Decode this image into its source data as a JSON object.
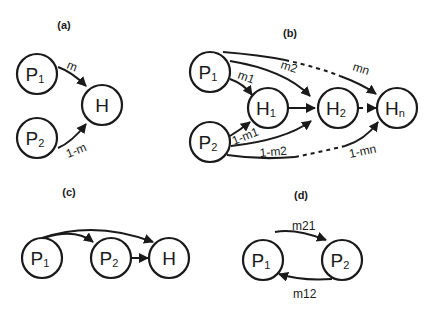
{
  "panels": {
    "a": {
      "label": "(a)",
      "nodes": {
        "p1": "P",
        "p1_sub": "1",
        "p2": "P",
        "p2_sub": "2",
        "h": "H"
      },
      "edges": {
        "p1_h": "m",
        "p2_h": "1-m"
      }
    },
    "b": {
      "label": "(b)",
      "nodes": {
        "p1": "P",
        "p1_sub": "1",
        "p2": "P",
        "p2_sub": "2",
        "h1": "H",
        "h1_sub": "1",
        "h2": "H",
        "h2_sub": "2",
        "hn": "H",
        "hn_sub": "n"
      },
      "edges": {
        "p1_h1": "m1",
        "p1_h2": "m2",
        "p1_hn": "mn",
        "p2_h1": "1-m1",
        "p2_h2": "1-m2",
        "p2_hn": "1-mn"
      }
    },
    "c": {
      "label": "(c)",
      "nodes": {
        "p1": "P",
        "p1_sub": "1",
        "p2": "P",
        "p2_sub": "2",
        "h": "H"
      }
    },
    "d": {
      "label": "(d)",
      "nodes": {
        "p1": "P",
        "p1_sub": "1",
        "p2": "P",
        "p2_sub": "2"
      },
      "edges": {
        "p1_p2": "m21",
        "p2_p1": "m12"
      }
    }
  },
  "colors": {
    "ink": "#1a1a1a",
    "background": "#ffffff"
  }
}
